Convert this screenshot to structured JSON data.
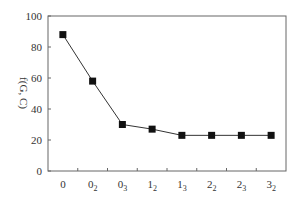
{
  "chart_data": {
    "type": "line",
    "title": "",
    "xlabel": "",
    "ylabel": "f(G, C)",
    "categories": [
      {
        "base": "0",
        "sub": ""
      },
      {
        "base": "0",
        "sub": "2"
      },
      {
        "base": "0",
        "sub": "3"
      },
      {
        "base": "1",
        "sub": "2"
      },
      {
        "base": "1",
        "sub": "3"
      },
      {
        "base": "2",
        "sub": "2"
      },
      {
        "base": "2",
        "sub": "3"
      },
      {
        "base": "3",
        "sub": "2"
      }
    ],
    "category_labels": [
      "0",
      "0_2",
      "0_3",
      "1_2",
      "1_3",
      "2_2",
      "2_3",
      "3_2"
    ],
    "series": [
      {
        "name": "f(G, C)",
        "values": [
          88,
          58,
          30,
          27,
          23,
          23,
          23,
          23
        ],
        "marker": "square",
        "color": "#111111"
      }
    ],
    "ylim": [
      0,
      100
    ],
    "yticks": [
      0,
      20,
      40,
      60,
      80,
      100
    ],
    "grid": false,
    "legend": "none"
  },
  "colors": {
    "line": "#333333",
    "marker": "#111111",
    "axis": "#666666"
  }
}
